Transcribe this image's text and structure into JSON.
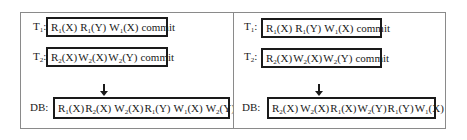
{
  "panels": [
    {
      "id": "left",
      "t1": {
        "label_base": "T",
        "label_sub": "1",
        "label_suffix": ":",
        "ops": [
          {
            "base": "R",
            "sub": "1",
            "arg": "(X)"
          },
          {
            "base": "R",
            "sub": "1",
            "arg": "(Y)"
          },
          {
            "base": "W",
            "sub": "1",
            "arg": "(X)"
          },
          {
            "base": "commit",
            "sub": "",
            "arg": ""
          }
        ]
      },
      "t2": {
        "label_base": "T",
        "label_sub": "2",
        "label_suffix": ":",
        "ops": [
          {
            "base": "R",
            "sub": "2",
            "arg": "(X)"
          },
          {
            "base": "W",
            "sub": "2",
            "arg": "(X)"
          },
          {
            "base": "W",
            "sub": "2",
            "arg": "(Y)"
          },
          {
            "base": "commit",
            "sub": "",
            "arg": ""
          }
        ]
      },
      "arrow": "down-arrow",
      "db": {
        "label": "DB:",
        "ops": [
          {
            "base": "R",
            "sub": "1",
            "arg": "(X)"
          },
          {
            "base": "R",
            "sub": "2",
            "arg": "(X)"
          },
          {
            "base": "W",
            "sub": "2",
            "arg": "(X)"
          },
          {
            "base": "R",
            "sub": "1",
            "arg": "(Y)"
          },
          {
            "base": "W",
            "sub": "1",
            "arg": "(X)"
          },
          {
            "base": "W",
            "sub": "2",
            "arg": "(Y)"
          }
        ]
      }
    },
    {
      "id": "right",
      "t1": {
        "label_base": "T",
        "label_sub": "1",
        "label_suffix": ":",
        "ops": [
          {
            "base": "R",
            "sub": "1",
            "arg": "(X)"
          },
          {
            "base": "R",
            "sub": "1",
            "arg": "(Y)"
          },
          {
            "base": "W",
            "sub": "1",
            "arg": "(X)"
          },
          {
            "base": "commit",
            "sub": "",
            "arg": ""
          }
        ]
      },
      "t2": {
        "label_base": "T",
        "label_sub": "2",
        "label_suffix": ":",
        "ops": [
          {
            "base": "R",
            "sub": "2",
            "arg": "(X)"
          },
          {
            "base": "W",
            "sub": "2",
            "arg": "(X)"
          },
          {
            "base": "W",
            "sub": "2",
            "arg": "(Y)"
          },
          {
            "base": "commit",
            "sub": "",
            "arg": ""
          }
        ]
      },
      "arrow": "down-arrow",
      "db": {
        "label": "DB:",
        "ops": [
          {
            "base": "R",
            "sub": "2",
            "arg": "(X)"
          },
          {
            "base": "W",
            "sub": "2",
            "arg": "(X)"
          },
          {
            "base": "R",
            "sub": "1",
            "arg": "(X)"
          },
          {
            "base": "W",
            "sub": "2",
            "arg": "(Y)"
          },
          {
            "base": "R",
            "sub": "1",
            "arg": "(Y)"
          },
          {
            "base": "W",
            "sub": "1",
            "arg": "(X)"
          }
        ]
      }
    }
  ]
}
